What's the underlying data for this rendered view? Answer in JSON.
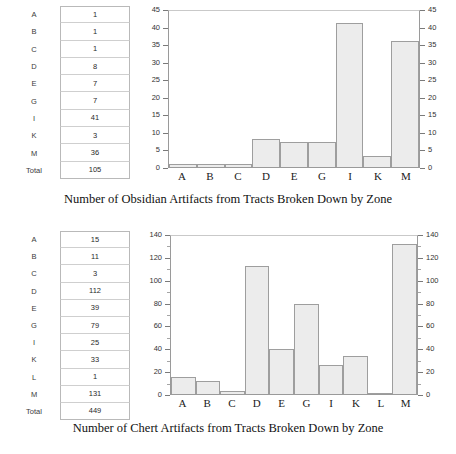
{
  "figure": {
    "panels": [
      {
        "id": "obsidian",
        "caption": "Number of Obsidian Artifacts from Tracts Broken Down by Zone",
        "table": {
          "rows": [
            {
              "label": "A",
              "value": "1"
            },
            {
              "label": "B",
              "value": "1"
            },
            {
              "label": "C",
              "value": "1"
            },
            {
              "label": "D",
              "value": "8"
            },
            {
              "label": "E",
              "value": "7"
            },
            {
              "label": "G",
              "value": "7"
            },
            {
              "label": "I",
              "value": "41"
            },
            {
              "label": "K",
              "value": "3"
            },
            {
              "label": "M",
              "value": "36"
            },
            {
              "label": "Total",
              "value": "105"
            }
          ]
        }
      },
      {
        "id": "chert",
        "caption": "Number of Chert Artifacts from Tracts Broken Down by Zone",
        "table": {
          "rows": [
            {
              "label": "A",
              "value": "15"
            },
            {
              "label": "B",
              "value": "11"
            },
            {
              "label": "C",
              "value": "3"
            },
            {
              "label": "D",
              "value": "112"
            },
            {
              "label": "E",
              "value": "39"
            },
            {
              "label": "G",
              "value": "79"
            },
            {
              "label": "I",
              "value": "25"
            },
            {
              "label": "K",
              "value": "33"
            },
            {
              "label": "L",
              "value": "1"
            },
            {
              "label": "M",
              "value": "131"
            },
            {
              "label": "Total",
              "value": "449"
            }
          ]
        }
      }
    ]
  },
  "chart_data": [
    {
      "type": "bar",
      "title": "Number of Obsidian Artifacts from Tracts Broken Down by Zone",
      "categories": [
        "A",
        "B",
        "C",
        "D",
        "E",
        "G",
        "I",
        "K",
        "M"
      ],
      "values": [
        1,
        1,
        1,
        8,
        7,
        7,
        41,
        3,
        36
      ],
      "xlabel": "",
      "ylabel": "",
      "ylim": [
        0,
        45
      ],
      "ytick_major": 5,
      "ytick_minor": 5,
      "yticks": [
        0,
        5,
        10,
        15,
        20,
        25,
        30,
        35,
        40,
        45
      ],
      "grid": false,
      "legend": "none",
      "dual_axis": true,
      "bar_fill": "#ececec",
      "bar_stroke": "#9e9e9e"
    },
    {
      "type": "bar",
      "title": "Number of Chert Artifacts from Tracts Broken Down by Zone",
      "categories": [
        "A",
        "B",
        "C",
        "D",
        "E",
        "G",
        "I",
        "K",
        "L",
        "M"
      ],
      "values": [
        15,
        11,
        3,
        112,
        39,
        79,
        25,
        33,
        1,
        131
      ],
      "xlabel": "",
      "ylabel": "",
      "ylim": [
        0,
        140
      ],
      "ytick_major": 20,
      "ytick_minor": 10,
      "yticks": [
        0,
        20,
        40,
        60,
        80,
        100,
        120,
        140
      ],
      "grid": false,
      "legend": "none",
      "dual_axis": true,
      "bar_fill": "#ececec",
      "bar_stroke": "#9e9e9e"
    }
  ]
}
